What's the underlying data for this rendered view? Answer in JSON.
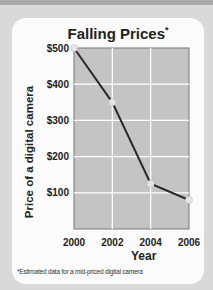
{
  "chart_data": {
    "type": "line",
    "title": "Falling Prices",
    "title_marker": "*",
    "xlabel": "Year",
    "ylabel": "Price of a digital camera",
    "x": [
      2000,
      2002,
      2004,
      2006
    ],
    "categories": [
      "2000",
      "2002",
      "2004",
      "2006"
    ],
    "series": [
      {
        "name": "Price",
        "values": [
          500,
          350,
          125,
          80
        ]
      }
    ],
    "yticks": [
      "$100",
      "$200",
      "$300",
      "$400",
      "$500"
    ],
    "ylim": [
      0,
      500
    ],
    "grid": true,
    "legend": "none",
    "footnote": "*Estimated data for a mid-priced digital camera"
  },
  "colors": {
    "plot_bg": "#c4c4c4",
    "line": "#2a2a2a",
    "marker": "#e6e6e6",
    "grid": "#ffffff"
  }
}
